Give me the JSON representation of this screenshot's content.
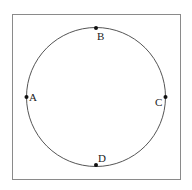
{
  "diagram": {
    "frame": {
      "x": 12.5,
      "y": 14.5,
      "width": 168,
      "height": 165,
      "stroke": "#8a8a8a"
    },
    "circle": {
      "cx": 96,
      "cy": 97,
      "r": 69.5,
      "stroke": "#555555"
    },
    "points": [
      {
        "name": "A",
        "x": 26.5,
        "y": 97,
        "label_x": 29,
        "label_y": 101
      },
      {
        "name": "B",
        "x": 96,
        "y": 28,
        "label_x": 97,
        "label_y": 40
      },
      {
        "name": "C",
        "x": 165.5,
        "y": 97,
        "label_x": 155,
        "label_y": 106
      },
      {
        "name": "D",
        "x": 96,
        "y": 165,
        "label_x": 98,
        "label_y": 162
      }
    ],
    "point_color": "#111111"
  }
}
